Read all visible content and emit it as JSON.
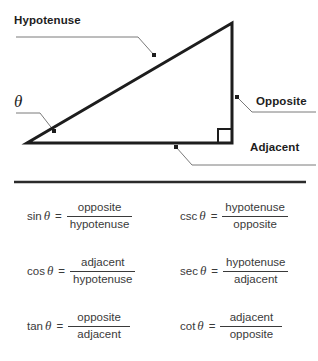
{
  "diagram": {
    "type": "right-triangle-trigonometry",
    "labels": {
      "hypotenuse": "Hypotenuse",
      "opposite": "Opposite",
      "adjacent": "Adjacent",
      "theta": "θ"
    },
    "geometry": {
      "vertex_angle": [
        27,
        143
      ],
      "vertex_right": [
        232,
        143
      ],
      "vertex_top": [
        232,
        23
      ],
      "right_angle_marker_size": 14,
      "stroke_color": "#1d1d1d",
      "stroke_width": 3,
      "leader_color": "#7a7a7a",
      "leader_width": 1
    }
  },
  "divider": {
    "color": "#2b2b2b",
    "x1": 14,
    "x2": 306,
    "y": 182,
    "thickness": 2
  },
  "formulas": {
    "equals": "=",
    "left_column": [
      {
        "name": "sin",
        "theta": "θ",
        "numerator": "opposite",
        "denominator": "hypotenuse"
      },
      {
        "name": "cos",
        "theta": "θ",
        "numerator": "adjacent",
        "denominator": "hypotenuse"
      },
      {
        "name": "tan",
        "theta": "θ",
        "numerator": "opposite",
        "denominator": "adjacent"
      }
    ],
    "right_column": [
      {
        "name": "csc",
        "theta": "θ",
        "numerator": "hypotenuse",
        "denominator": "opposite"
      },
      {
        "name": "sec",
        "theta": "θ",
        "numerator": "hypotenuse",
        "denominator": "adjacent"
      },
      {
        "name": "cot",
        "theta": "θ",
        "numerator": "adjacent",
        "denominator": "opposite"
      }
    ]
  }
}
